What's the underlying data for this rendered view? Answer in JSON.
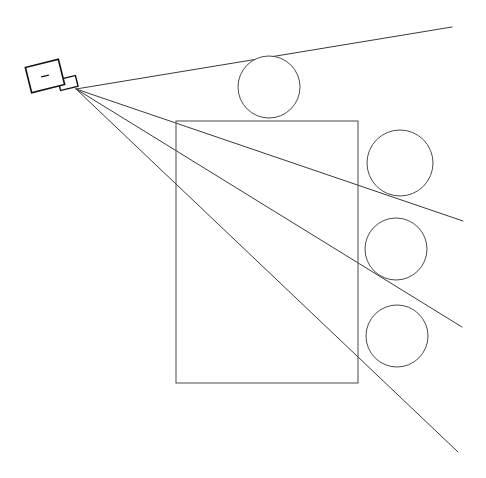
{
  "canvas": {
    "width": 486,
    "height": 478,
    "background_color": "#ffffff",
    "title": "Sensor Ray Casting Diagram"
  },
  "style": {
    "line_color": "#3a3a3a",
    "shape_stroke_color": "#4a4a4a",
    "sensor_stroke_color": "#111111",
    "fill_color": "#ffffff",
    "stroke_width": 1
  },
  "sensor": {
    "label": "sensor",
    "body": {
      "center_x": 45,
      "center_y": 76,
      "width": 34,
      "height": 26,
      "rotation_deg": -14
    },
    "lens": {
      "center_x": 68,
      "center_y": 83,
      "width": 18,
      "height": 11,
      "rotation_deg": -14
    },
    "indicator": {
      "x": 45,
      "y": 76,
      "length": 8,
      "rotation_deg": -14
    },
    "ray_origin": {
      "x": 76,
      "y": 89
    }
  },
  "rays": [
    {
      "name": "ray-1",
      "x1": 76,
      "y1": 89,
      "x2": 452,
      "y2": 27
    },
    {
      "name": "ray-2",
      "x1": 76,
      "y1": 89,
      "x2": 463,
      "y2": 221
    },
    {
      "name": "ray-3",
      "x1": 76,
      "y1": 89,
      "x2": 462,
      "y2": 327
    },
    {
      "name": "ray-4",
      "x1": 76,
      "y1": 89,
      "x2": 458,
      "y2": 452
    }
  ],
  "obstacles": {
    "rectangle": {
      "name": "rectangle-obstacle",
      "x": 176,
      "y": 121,
      "width": 182,
      "height": 262
    },
    "circles": [
      {
        "name": "circle-top",
        "cx": 269,
        "cy": 87,
        "r": 31
      },
      {
        "name": "circle-right-1",
        "cx": 400,
        "cy": 163,
        "r": 33
      },
      {
        "name": "circle-right-2",
        "cx": 396,
        "cy": 249,
        "r": 31
      },
      {
        "name": "circle-right-3",
        "cx": 397,
        "cy": 336,
        "r": 31
      }
    ]
  },
  "chart_data": {
    "type": "scatter",
    "xlabel": "",
    "ylabel": "",
    "xlim": [
      0,
      486
    ],
    "ylim": [
      0,
      478
    ],
    "grid": false,
    "legend": "none",
    "annotations": [
      "sensor emits 4 rays from origin (76, 89)",
      "rectangle obstacle spans x 176-358, y 121-383",
      "four circular obstacles arranged top and right"
    ],
    "series": [
      {
        "name": "ray-endpoints",
        "x": [
          452,
          463,
          462,
          458
        ],
        "y": [
          27,
          221,
          327,
          452
        ]
      },
      {
        "name": "circle-centers",
        "x": [
          269,
          400,
          396,
          397
        ],
        "y": [
          87,
          163,
          249,
          336
        ]
      }
    ]
  }
}
